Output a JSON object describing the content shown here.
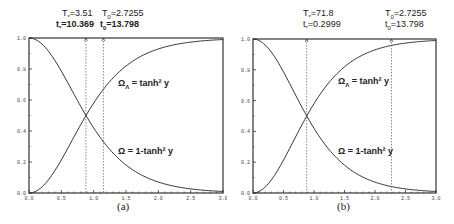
{
  "chart_data": [
    {
      "panel": "(a)",
      "type": "line",
      "title": "",
      "xlabel": "",
      "ylabel": "",
      "xlim": [
        0.0,
        3.0
      ],
      "ylim": [
        0.0,
        1.0
      ],
      "xticks": [
        "0.0",
        "0.5",
        "1.0",
        "1.5",
        "2.0",
        "2.5",
        "3.0"
      ],
      "yticks": [
        "0.0",
        "0.2",
        "0.4",
        "0.6",
        "0.8",
        "1.0"
      ],
      "grid": false,
      "series": [
        {
          "name": "Ω_Λ = tanh² y",
          "x": [
            0.0,
            0.25,
            0.5,
            0.75,
            0.88,
            1.0,
            1.25,
            1.5,
            1.75,
            2.0,
            2.5,
            3.0
          ],
          "values": [
            0.0,
            0.06,
            0.21,
            0.4,
            0.5,
            0.58,
            0.72,
            0.82,
            0.89,
            0.93,
            0.97,
            0.99
          ]
        },
        {
          "name": "Ω = 1-tanh² y",
          "x": [
            0.0,
            0.25,
            0.5,
            0.75,
            0.88,
            1.0,
            1.25,
            1.5,
            1.75,
            2.0,
            2.5,
            3.0
          ],
          "values": [
            1.0,
            0.94,
            0.79,
            0.6,
            0.5,
            0.42,
            0.28,
            0.18,
            0.11,
            0.07,
            0.03,
            0.01
          ]
        }
      ],
      "markers": [
        {
          "x": 0.88,
          "style": "dashed vertical",
          "label_T": "T*=3.51",
          "label_t": "t*=10.369"
        },
        {
          "x": 1.15,
          "style": "dashed vertical",
          "label_T": "T0=2.7255",
          "label_t": "t0=13.798"
        }
      ]
    },
    {
      "panel": "(b)",
      "type": "line",
      "title": "",
      "xlabel": "",
      "ylabel": "",
      "xlim": [
        0.0,
        3.0
      ],
      "ylim": [
        0.0,
        1.0
      ],
      "xticks": [
        "0.0",
        "0.5",
        "1.0",
        "1.5",
        "2.0",
        "2.5",
        "3.0"
      ],
      "yticks": [
        "0.0",
        "0.2",
        "0.4",
        "0.6",
        "0.8",
        "1.0"
      ],
      "grid": false,
      "series": [
        {
          "name": "Ω_Λ = tanh² y",
          "x": [
            0.0,
            0.25,
            0.5,
            0.75,
            0.88,
            1.0,
            1.25,
            1.5,
            1.75,
            2.0,
            2.5,
            3.0
          ],
          "values": [
            0.0,
            0.06,
            0.21,
            0.4,
            0.5,
            0.58,
            0.72,
            0.82,
            0.89,
            0.93,
            0.97,
            0.99
          ]
        },
        {
          "name": "Ω = 1-tanh² y",
          "x": [
            0.0,
            0.25,
            0.5,
            0.75,
            0.88,
            1.0,
            1.25,
            1.5,
            1.75,
            2.0,
            2.5,
            3.0
          ],
          "values": [
            1.0,
            0.94,
            0.79,
            0.6,
            0.5,
            0.42,
            0.28,
            0.18,
            0.11,
            0.07,
            0.03,
            0.01
          ]
        }
      ],
      "markers": [
        {
          "x": 0.88,
          "style": "dashed vertical",
          "label_T": "T*=71.8",
          "label_t": "t*=0.2999"
        },
        {
          "x": 2.27,
          "style": "dashed vertical",
          "label_T": "T0=2.7255",
          "label_t": "t0=13.798"
        }
      ]
    }
  ],
  "panels": {
    "a": {
      "caption": "(a)",
      "m1_T": "T",
      "m1_T_sub": "*",
      "m1_T_val": "=3.51",
      "m1_t": "t",
      "m1_t_sub": "*",
      "m1_t_val": "=10.369",
      "m2_T": "T",
      "m2_T_sub": "0",
      "m2_T_val": "=2.7255",
      "m2_t": "t",
      "m2_t_sub": "0",
      "m2_t_val": "=13.798",
      "label_lambda": "Ω",
      "label_lambda_sub": "Λ",
      "label_lambda_eq": " = tanh² y",
      "label_omega": "Ω = 1-tanh² y"
    },
    "b": {
      "caption": "(b)",
      "m1_T": "T",
      "m1_T_sub": "*",
      "m1_T_val": "=71.8",
      "m1_t": "t",
      "m1_t_sub": "*",
      "m1_t_val": "=0.2999",
      "m2_T": "T",
      "m2_T_sub": "0",
      "m2_T_val": "=2.7255",
      "m2_t": "t",
      "m2_t_sub": "0",
      "m2_t_val": "=13.798",
      "label_lambda": "Ω",
      "label_lambda_sub": "Λ",
      "label_lambda_eq": " = tanh² y",
      "label_omega": "Ω = 1-tanh² y"
    }
  }
}
